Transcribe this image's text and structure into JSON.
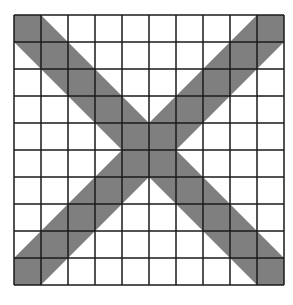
{
  "figure": {
    "grid": {
      "rows": 10,
      "cols": 10,
      "origin_x": 14,
      "origin_y": 15,
      "cell_size": 27,
      "line_color": "#1a1a1a",
      "line_width": 1.5
    },
    "shading": {
      "fill_color": "#7f7f7f",
      "bands": [
        {
          "name": "diagonal-top-left-to-bottom-right",
          "from_corner": "top-left",
          "to_corner": "bottom-right"
        },
        {
          "name": "diagonal-top-right-to-bottom-left",
          "from_corner": "top-right",
          "to_corner": "bottom-left"
        }
      ],
      "band_width_cells": 1
    },
    "background_color": "#ffffff"
  }
}
